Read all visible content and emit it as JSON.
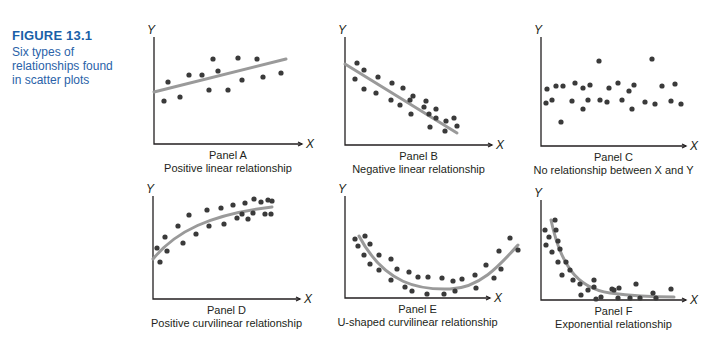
{
  "figure": {
    "number": "FIGURE 13.1",
    "caption": "Six types of relationships found in scatter plots",
    "caption_lines": [
      "Six types of",
      "relationships found",
      "in scatter plots"
    ]
  },
  "colors": {
    "caption": "#2a62a8",
    "points": "#3a3a3a",
    "fit_line": "#9a9a9a",
    "axes": "#231f20"
  },
  "chart_data": [
    {
      "type": "scatter",
      "panel": "Panel A",
      "title": "Positive linear relationship",
      "xlabel": "X",
      "ylabel": "Y",
      "fit": "linear increasing",
      "axes": {
        "ox": 154,
        "oy": 144,
        "xmax": 302,
        "ytop": 37
      },
      "points": [
        [
          164,
          101
        ],
        [
          168,
          82
        ],
        [
          180,
          97
        ],
        [
          189,
          75
        ],
        [
          202,
          75
        ],
        [
          213,
          59
        ],
        [
          209,
          90
        ],
        [
          218,
          71
        ],
        [
          228,
          90
        ],
        [
          238,
          58
        ],
        [
          242,
          80
        ],
        [
          257,
          59
        ],
        [
          263,
          77
        ],
        [
          281,
          73
        ]
      ],
      "curve": "M154,92 L286,59"
    },
    {
      "type": "scatter",
      "panel": "Panel B",
      "title": "Negative linear relationship",
      "xlabel": "X",
      "ylabel": "Y",
      "fit": "linear decreasing",
      "axes": {
        "ox": 345,
        "oy": 145,
        "xmax": 492,
        "ytop": 37
      },
      "points": [
        [
          357,
          63
        ],
        [
          355,
          79
        ],
        [
          364,
          70
        ],
        [
          364,
          89
        ],
        [
          378,
          77
        ],
        [
          376,
          93
        ],
        [
          392,
          83
        ],
        [
          391,
          100
        ],
        [
          403,
          88
        ],
        [
          400,
          105
        ],
        [
          413,
          96
        ],
        [
          411,
          114
        ],
        [
          410,
          100
        ],
        [
          426,
          101
        ],
        [
          424,
          107
        ],
        [
          436,
          118
        ],
        [
          430,
          127
        ],
        [
          436,
          109
        ],
        [
          446,
          121
        ],
        [
          429,
          114
        ],
        [
          445,
          131
        ],
        [
          454,
          118
        ],
        [
          457,
          126
        ]
      ],
      "curve": "M345,64 L457,133"
    },
    {
      "type": "scatter",
      "panel": "Panel C",
      "title": "No relationship between X and Y",
      "xlabel": "X",
      "ylabel": "Y",
      "fit": "none",
      "axes": {
        "ox": 541,
        "oy": 146,
        "xmax": 686,
        "ytop": 37
      },
      "points": [
        [
          546,
          103
        ],
        [
          547,
          89
        ],
        [
          552,
          100
        ],
        [
          556,
          86
        ],
        [
          563,
          86
        ],
        [
          561,
          122
        ],
        [
          572,
          101
        ],
        [
          575,
          83
        ],
        [
          583,
          88
        ],
        [
          583,
          109
        ],
        [
          588,
          100
        ],
        [
          590,
          85
        ],
        [
          599,
          61
        ],
        [
          600,
          100
        ],
        [
          607,
          102
        ],
        [
          609,
          88
        ],
        [
          618,
          83
        ],
        [
          622,
          100
        ],
        [
          629,
          91
        ],
        [
          632,
          109
        ],
        [
          634,
          85
        ],
        [
          645,
          102
        ],
        [
          652,
          59
        ],
        [
          655,
          104
        ],
        [
          662,
          86
        ],
        [
          671,
          101
        ],
        [
          675,
          84
        ],
        [
          681,
          104
        ]
      ],
      "curve": null
    },
    {
      "type": "scatter",
      "panel": "Panel D",
      "title": "Positive curvilinear relationship",
      "xlabel": "X",
      "ylabel": "Y",
      "fit": "concave increasing curve",
      "axes": {
        "ox": 153,
        "oy": 299,
        "xmax": 300,
        "ytop": 196
      },
      "points": [
        [
          157,
          248
        ],
        [
          160,
          262
        ],
        [
          165,
          237
        ],
        [
          167,
          251
        ],
        [
          178,
          226
        ],
        [
          183,
          243
        ],
        [
          189,
          215
        ],
        [
          196,
          234
        ],
        [
          207,
          210
        ],
        [
          209,
          226
        ],
        [
          221,
          208
        ],
        [
          224,
          224
        ],
        [
          233,
          205
        ],
        [
          237,
          218
        ],
        [
          245,
          203
        ],
        [
          242,
          214
        ],
        [
          248,
          219
        ],
        [
          253,
          213
        ],
        [
          254,
          199
        ],
        [
          261,
          202
        ],
        [
          265,
          214
        ],
        [
          268,
          200
        ],
        [
          271,
          214
        ],
        [
          272,
          201
        ]
      ],
      "curve": "M153,259 C175,232 210,214 272,207"
    },
    {
      "type": "scatter",
      "panel": "Panel E",
      "title": "U-shaped curvilinear relationship",
      "xlabel": "X",
      "ylabel": "Y",
      "fit": "U-shaped curve",
      "axes": {
        "ox": 345,
        "oy": 298,
        "xmax": 490,
        "ytop": 196
      },
      "points": [
        [
          355,
          239
        ],
        [
          358,
          246
        ],
        [
          365,
          236
        ],
        [
          370,
          244
        ],
        [
          364,
          255
        ],
        [
          370,
          264
        ],
        [
          379,
          255
        ],
        [
          379,
          270
        ],
        [
          391,
          259
        ],
        [
          391,
          280
        ],
        [
          397,
          269
        ],
        [
          405,
          287
        ],
        [
          409,
          272
        ],
        [
          412,
          291
        ],
        [
          418,
          277
        ],
        [
          427,
          294
        ],
        [
          428,
          277
        ],
        [
          442,
          278
        ],
        [
          444,
          294
        ],
        [
          453,
          281
        ],
        [
          455,
          291
        ],
        [
          462,
          279
        ],
        [
          475,
          275
        ],
        [
          476,
          288
        ],
        [
          486,
          265
        ],
        [
          494,
          278
        ],
        [
          499,
          251
        ],
        [
          501,
          269
        ],
        [
          510,
          238
        ],
        [
          518,
          250
        ]
      ],
      "curve": "M359,236 C385,285 420,290 450,289 C480,288 500,265 518,245"
    },
    {
      "type": "scatter",
      "panel": "Panel F",
      "title": "Exponential relationship",
      "xlabel": "X",
      "ylabel": "Y",
      "fit": "exponential decay curve",
      "axes": {
        "ox": 541,
        "oy": 300,
        "xmax": 686,
        "ytop": 200
      },
      "points": [
        [
          545,
          230
        ],
        [
          546,
          245
        ],
        [
          549,
          237
        ],
        [
          552,
          252
        ],
        [
          555,
          220
        ],
        [
          556,
          230
        ],
        [
          558,
          241
        ],
        [
          560,
          249
        ],
        [
          558,
          262
        ],
        [
          562,
          275
        ],
        [
          566,
          262
        ],
        [
          570,
          270
        ],
        [
          573,
          280
        ],
        [
          580,
          284
        ],
        [
          581,
          295
        ],
        [
          588,
          290
        ],
        [
          596,
          299
        ],
        [
          594,
          280
        ],
        [
          594,
          287
        ],
        [
          601,
          297
        ],
        [
          612,
          289
        ],
        [
          614,
          290
        ],
        [
          618,
          298
        ],
        [
          619,
          288
        ],
        [
          630,
          298
        ],
        [
          636,
          284
        ],
        [
          640,
          298
        ],
        [
          653,
          293
        ],
        [
          656,
          298
        ],
        [
          671,
          289
        ]
      ],
      "curve": "M551,220 C560,262 575,288 610,293 C640,297 665,297 674,297"
    }
  ],
  "panels": [
    {
      "name": "Panel A",
      "subtitle": "Positive linear relationship"
    },
    {
      "name": "Panel B",
      "subtitle": "Negative linear relationship"
    },
    {
      "name": "Panel C",
      "subtitle": "No relationship between X and Y"
    },
    {
      "name": "Panel D",
      "subtitle": "Positive curvilinear relationship"
    },
    {
      "name": "Panel E",
      "subtitle": "U-shaped curvilinear relationship"
    },
    {
      "name": "Panel F",
      "subtitle": "Exponential relationship"
    }
  ],
  "axis_labels": {
    "x": "X",
    "y": "Y"
  }
}
